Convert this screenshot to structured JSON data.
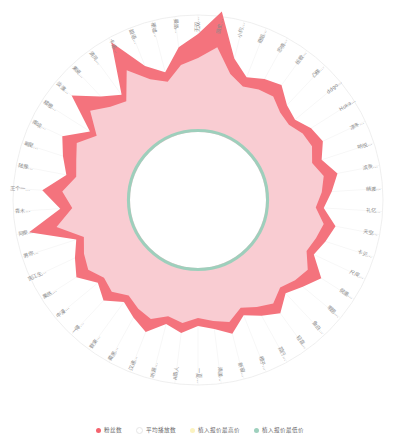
{
  "title": "",
  "legend": {
    "items": [
      {
        "label": "粉丝数",
        "color": "#f4636e",
        "marker": "legend-dot-fans"
      },
      {
        "label": "平均播放数",
        "color": "#ffffff",
        "marker": "legend-dot-avg-plays"
      },
      {
        "label": "植入报价最高价",
        "color": "#fbf3c0",
        "marker": "legend-dot-max-price"
      },
      {
        "label": "植入报价最低价",
        "color": "#9ed0bd",
        "marker": "legend-dot-min-price"
      }
    ]
  },
  "colors": {
    "series_fans": "#f4737d",
    "series_avg_plays": "#f9ccd2",
    "series_min_price": "#9ecfbc",
    "axis_ring": "#e8e8e8",
    "label_text": "#8a8a8a",
    "background": "#ffffff"
  },
  "chart_data": {
    "type": "radar",
    "title": "",
    "subtitle": "",
    "xlabel": "",
    "ylabel": "",
    "grid": false,
    "legend_position": "bottom",
    "center": {
      "x": 198,
      "y": 200
    },
    "radii": {
      "outer_ring": 185,
      "label_ring": 168,
      "value_max": 122,
      "inner_hole": 68
    },
    "categories": [
      "无双...",
      "固史...",
      "小约...",
      "奇蹈...",
      "忠情...",
      "绘歌...",
      "凸梯...",
      "ddgo...",
      "Hoka...",
      "凉冬...",
      "呐悦...",
      "滨贡...",
      "萌渡...",
      "礼亿...",
      "天空...",
      "卡贝...",
      "尺皮...",
      "倪墨...",
      "暇思...",
      "鱼白...",
      "轻音...",
      "孤行...",
      "橙子...",
      "新窗...",
      "清漾...",
      "一夏...",
      "A路人",
      "听源...",
      "汉逮...",
      "戴黑...",
      "数束...",
      "一得...",
      "中漫...",
      "果然...",
      "宪江生...",
      "男你...",
      "阿泰...",
      "青木...",
      "王个一...",
      "陆豫...",
      "暇星...",
      "南境...",
      "樱橙...",
      "淡渡...",
      "素瓷...",
      "清风...",
      "卡诺...",
      "甜语...",
      "硬嘘...",
      "曼路..."
    ],
    "series": [
      {
        "name": "粉丝数",
        "color": "#f4737d",
        "values": [
          98,
          122,
          78,
          64,
          70,
          74,
          62,
          58,
          66,
          70,
          62,
          74,
          66,
          58,
          72,
          66,
          60,
          78,
          68,
          60,
          72,
          64,
          56,
          70,
          62,
          58,
          66,
          60,
          74,
          66,
          58,
          70,
          62,
          76,
          68,
          60,
          104,
          70,
          88,
          66,
          74,
          82,
          60,
          96,
          74,
          62,
          112,
          76,
          64,
          86
        ]
      },
      {
        "name": "平均播放数",
        "color": "#ffffff",
        "values": [
          0,
          0,
          0,
          0,
          0,
          0,
          0,
          0,
          0,
          0,
          0,
          0,
          0,
          0,
          0,
          0,
          0,
          0,
          0,
          0,
          0,
          0,
          0,
          0,
          0,
          0,
          0,
          0,
          0,
          0,
          0,
          0,
          0,
          0,
          0,
          0,
          0,
          0,
          0,
          0,
          0,
          0,
          0,
          0,
          0,
          0,
          0,
          0,
          0,
          0
        ]
      },
      {
        "name": "植入报价最高价",
        "color": "#f9ccd2",
        "values": [
          74,
          86,
          62,
          54,
          58,
          60,
          52,
          50,
          56,
          58,
          52,
          60,
          56,
          50,
          60,
          56,
          52,
          62,
          58,
          52,
          60,
          54,
          48,
          58,
          54,
          50,
          56,
          52,
          60,
          56,
          50,
          58,
          54,
          62,
          58,
          52,
          76,
          58,
          68,
          56,
          60,
          66,
          52,
          72,
          60,
          54,
          80,
          62,
          54,
          68
        ]
      },
      {
        "name": "植入报价最低价",
        "color": "#9ecfbc",
        "values": [
          70,
          70,
          70,
          70,
          70,
          70,
          70,
          70,
          70,
          70,
          70,
          70,
          70,
          70,
          70,
          70,
          70,
          70,
          70,
          70,
          70,
          70,
          70,
          70,
          70,
          70,
          70,
          70,
          70,
          70,
          70,
          70,
          70,
          70,
          70,
          70,
          70,
          70,
          70,
          70,
          70,
          70,
          70,
          70,
          70,
          70,
          70,
          70,
          70,
          70
        ]
      }
    ]
  }
}
